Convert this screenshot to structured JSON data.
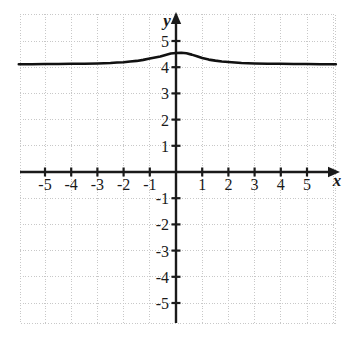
{
  "chart_data": {
    "type": "line",
    "title": "",
    "xlabel": "x",
    "ylabel": "y",
    "xlim": [
      -6.0,
      6.1
    ],
    "ylim": [
      -6.1,
      6.4
    ],
    "grid": true,
    "grid_style": "dotted",
    "legend": "none",
    "x_ticks": [
      -5,
      -4,
      -3,
      -2,
      -1,
      1,
      2,
      3,
      4,
      5
    ],
    "y_ticks": [
      5,
      4,
      3,
      2,
      1,
      -1,
      -2,
      -3,
      -4,
      -5
    ],
    "x_tick_labels": [
      "-5",
      "-4",
      "-3",
      "-2",
      "-1",
      "1",
      "2",
      "3",
      "4",
      "5"
    ],
    "y_tick_labels": [
      "5",
      "4",
      "3",
      "2",
      "1",
      "-1",
      "-2",
      "-3",
      "-4",
      "-5"
    ],
    "axis_arrows": [
      "x-positive",
      "y-positive"
    ],
    "series": [
      {
        "name": "curve",
        "color": "#111111",
        "description": "bell-shaped bump asymptotic to y=4.1, peak near x=0.2 at y=4.55",
        "x": [
          -6.0,
          -5.5,
          -5.0,
          -4.5,
          -4.0,
          -3.5,
          -3.0,
          -2.75,
          -2.5,
          -2.25,
          -2.0,
          -1.75,
          -1.5,
          -1.25,
          -1.0,
          -0.8,
          -0.6,
          -0.4,
          -0.2,
          0.0,
          0.2,
          0.4,
          0.6,
          0.8,
          1.0,
          1.25,
          1.5,
          1.75,
          2.0,
          2.25,
          2.5,
          2.75,
          3.0,
          3.5,
          4.0,
          4.5,
          5.0,
          5.5,
          6.1
        ],
        "y": [
          4.11,
          4.11,
          4.12,
          4.12,
          4.13,
          4.13,
          4.14,
          4.15,
          4.16,
          4.18,
          4.19,
          4.22,
          4.24,
          4.28,
          4.33,
          4.37,
          4.41,
          4.47,
          4.52,
          4.54,
          4.55,
          4.53,
          4.48,
          4.42,
          4.35,
          4.29,
          4.25,
          4.22,
          4.2,
          4.18,
          4.16,
          4.15,
          4.14,
          4.13,
          4.13,
          4.12,
          4.12,
          4.11,
          4.11
        ]
      }
    ]
  },
  "axes": {
    "x_axis_label": "x",
    "y_axis_label": "y"
  },
  "ticks": {
    "x": [
      {
        "value": -5,
        "label": "-5"
      },
      {
        "value": -4,
        "label": "-4"
      },
      {
        "value": -3,
        "label": "-3"
      },
      {
        "value": -2,
        "label": "-2"
      },
      {
        "value": -1,
        "label": "-1"
      },
      {
        "value": 1,
        "label": "1"
      },
      {
        "value": 2,
        "label": "2"
      },
      {
        "value": 3,
        "label": "3"
      },
      {
        "value": 4,
        "label": "4"
      },
      {
        "value": 5,
        "label": "5"
      }
    ],
    "y": [
      {
        "value": 5,
        "label": "5"
      },
      {
        "value": 4,
        "label": "4"
      },
      {
        "value": 3,
        "label": "3"
      },
      {
        "value": 2,
        "label": "2"
      },
      {
        "value": 1,
        "label": "1"
      },
      {
        "value": -1,
        "label": "-1"
      },
      {
        "value": -2,
        "label": "-2"
      },
      {
        "value": -3,
        "label": "-3"
      },
      {
        "value": -4,
        "label": "-4"
      },
      {
        "value": -5,
        "label": "-5"
      }
    ]
  },
  "style": {
    "background": "#ffffff",
    "grid_color": "#c8c8c8",
    "axis_color": "#1a1a1a",
    "curve_color": "#111111"
  }
}
